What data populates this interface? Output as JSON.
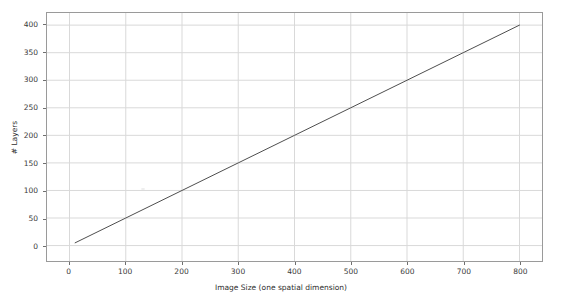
{
  "chart_data": {
    "type": "line",
    "title": "",
    "xlabel": "Image Size (one spatial dimension)",
    "ylabel": "# Layers",
    "xlim": [
      -40,
      840
    ],
    "ylim": [
      -28,
      422
    ],
    "xticks": [
      0,
      100,
      200,
      300,
      400,
      500,
      600,
      700,
      800
    ],
    "yticks": [
      0,
      50,
      100,
      150,
      200,
      250,
      300,
      350,
      400
    ],
    "xtick_labels": [
      "0",
      "100",
      "200",
      "300",
      "400",
      "500",
      "600",
      "700",
      "800"
    ],
    "ytick_labels": [
      "0",
      "50",
      "100",
      "150",
      "200",
      "250",
      "300",
      "350",
      "400"
    ],
    "grid": true,
    "legend": null,
    "series": [
      {
        "name": "# Layers vs Image Size",
        "color": "#4d4d4d",
        "linewidth": 1,
        "x": [
          10,
          100,
          200,
          300,
          400,
          500,
          600,
          700,
          800
        ],
        "y": [
          5,
          50,
          100,
          150,
          200,
          250,
          300,
          350,
          400
        ]
      }
    ]
  },
  "colors": {
    "background": "#ffffff",
    "grid": "#d9d9d9",
    "axis_frame": "#9a9a9a",
    "tick_text": "#3a3a3a",
    "label_text": "#2e2e2e",
    "line": "#4d4d4d"
  }
}
